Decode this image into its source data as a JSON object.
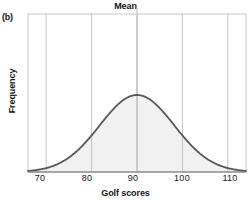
{
  "figure": {
    "panel_label": "(b)",
    "title": "Mean"
  },
  "chart_data": {
    "type": "area",
    "title": "Mean",
    "xlabel": "Golf scores",
    "ylabel": "Frequency",
    "xlim": [
      66,
      114
    ],
    "ylim": [
      0,
      1
    ],
    "grid": true,
    "gridlines_x": [
      70,
      80,
      90,
      100,
      110
    ],
    "xticks": [
      70,
      80,
      90,
      100,
      110
    ],
    "xticklabels": [
      "70",
      "80",
      "90",
      "100",
      "110"
    ],
    "yticks": [],
    "yticklabels": [],
    "legend": null,
    "annotations": [
      {
        "text": "Mean",
        "x": 90,
        "position": "above-axis",
        "pointer": "vertical-line"
      }
    ],
    "series": [
      {
        "name": "Golf score distribution",
        "kind": "normal-curve",
        "mean": 90,
        "std": 8.2,
        "peak_value": 1.0,
        "line_color": "#575757",
        "fill_color": "#f1f1f1",
        "x": [
          66,
          68,
          70,
          72,
          74,
          76,
          78,
          80,
          82,
          84,
          86,
          88,
          90,
          92,
          94,
          96,
          98,
          100,
          102,
          104,
          106,
          108,
          110,
          112,
          114
        ],
        "y": [
          0.008,
          0.018,
          0.038,
          0.074,
          0.133,
          0.222,
          0.344,
          0.493,
          0.65,
          0.793,
          0.901,
          0.974,
          1.0,
          0.974,
          0.901,
          0.793,
          0.65,
          0.493,
          0.344,
          0.222,
          0.133,
          0.074,
          0.038,
          0.018,
          0.008
        ]
      }
    ]
  },
  "axes": {
    "frame_color": "#c8c8c8",
    "grid_color": "#c4c4c4"
  }
}
